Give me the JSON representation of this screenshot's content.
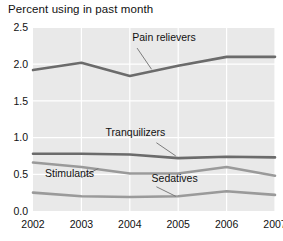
{
  "chart_data": {
    "type": "line",
    "title": "Percent using in past month",
    "xlabel": "",
    "ylabel": "",
    "categories": [
      "2002",
      "2003",
      "2004",
      "2005",
      "2006",
      "2007"
    ],
    "x": [
      2002,
      2003,
      2004,
      2005,
      2006,
      2007
    ],
    "ylim": [
      0.0,
      2.5
    ],
    "yticks": [
      "0.0",
      "0.5",
      "1.0",
      "1.5",
      "2.0",
      "2.5"
    ],
    "ytick_values": [
      0.0,
      0.5,
      1.0,
      1.5,
      2.0,
      2.5
    ],
    "grid": true,
    "legend_position": "inline-annotations",
    "series": [
      {
        "name": "Pain relievers",
        "values": [
          1.92,
          2.02,
          1.84,
          1.98,
          2.1,
          2.1
        ],
        "color": "#6b6b6b",
        "label_x": 2004.05,
        "label_y": 2.32
      },
      {
        "name": "Tranquilizers",
        "values": [
          0.78,
          0.78,
          0.77,
          0.72,
          0.74,
          0.73
        ],
        "color": "#6b6b6b",
        "label_x": 2003.5,
        "label_y": 1.02
      },
      {
        "name": "Stimulants",
        "values": [
          0.66,
          0.6,
          0.51,
          0.51,
          0.6,
          0.48
        ],
        "color": "#9a9a9a",
        "label_x": 2002.25,
        "label_y": 0.46
      },
      {
        "name": "Sedatives",
        "values": [
          0.25,
          0.2,
          0.19,
          0.2,
          0.27,
          0.22
        ],
        "color": "#9a9a9a",
        "label_x": 2004.45,
        "label_y": 0.4
      }
    ],
    "annotations": [
      {
        "series": "Pain relievers",
        "from_x": 2004.15,
        "from_y": 2.22,
        "to_x": 2004.45,
        "to_y": 1.93
      },
      {
        "series": "Tranquilizers",
        "from_x": 2004.55,
        "from_y": 0.93,
        "to_x": 2004.95,
        "to_y": 0.75
      },
      {
        "series": "Stimulants",
        "from_x": 2003.0,
        "from_y": 0.455,
        "to_x": 2003.35,
        "to_y": 0.58
      },
      {
        "series": "Sedatives",
        "from_x": 2004.55,
        "from_y": 0.33,
        "to_x": 2004.95,
        "to_y": 0.2
      }
    ],
    "colors": {
      "plot_background": "#e9e9e9",
      "gridline": "#ffffff",
      "dark_series": "#6b6b6b",
      "light_series": "#9a9a9a",
      "text": "#111111"
    }
  }
}
